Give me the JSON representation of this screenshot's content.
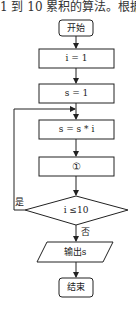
{
  "caption": "1 到 10 累积的算法。根据",
  "flowchart": {
    "nodes": [
      {
        "id": "start",
        "type": "terminal",
        "label": "开始"
      },
      {
        "id": "init_i",
        "type": "process",
        "label": "i = 1"
      },
      {
        "id": "init_s",
        "type": "process",
        "label": "s = 1"
      },
      {
        "id": "multiply",
        "type": "process",
        "label": "s = s * i"
      },
      {
        "id": "step1",
        "type": "process",
        "label": "①"
      },
      {
        "id": "cond",
        "type": "decision",
        "label": "i ≤10"
      },
      {
        "id": "output",
        "type": "io",
        "label": "输出s"
      },
      {
        "id": "end",
        "type": "terminal",
        "label": "结束"
      }
    ],
    "edges": [
      {
        "from": "start",
        "to": "init_i",
        "label": ""
      },
      {
        "from": "init_i",
        "to": "init_s",
        "label": ""
      },
      {
        "from": "init_s",
        "to": "multiply",
        "label": ""
      },
      {
        "from": "multiply",
        "to": "step1",
        "label": ""
      },
      {
        "from": "step1",
        "to": "cond",
        "label": ""
      },
      {
        "from": "cond",
        "to": "multiply",
        "label": "是"
      },
      {
        "from": "cond",
        "to": "output",
        "label": "否"
      },
      {
        "from": "output",
        "to": "end",
        "label": ""
      }
    ],
    "yes_label": "是",
    "no_label": "否"
  }
}
